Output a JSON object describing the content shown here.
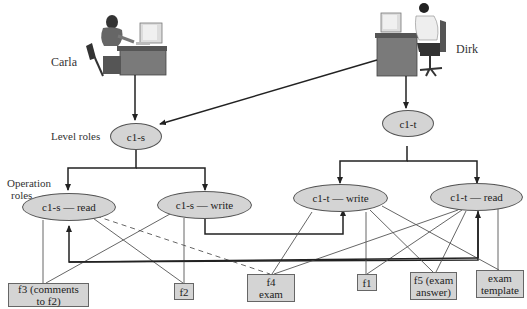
{
  "people": {
    "carla": {
      "name": "Carla"
    },
    "dirk": {
      "name": "Dirk"
    }
  },
  "labels": {
    "level_roles": "Level roles",
    "operation_roles_line1": "Operation",
    "operation_roles_line2": "roles"
  },
  "level_roles": [
    {
      "id": "c1s",
      "label": "c1-s"
    },
    {
      "id": "c1t",
      "label": "c1-t"
    }
  ],
  "operation_roles": [
    {
      "id": "c1s_read",
      "label": "c1-s — read"
    },
    {
      "id": "c1s_write",
      "label": "c1-s — write"
    },
    {
      "id": "c1t_write",
      "label": "c1-t — write"
    },
    {
      "id": "c1t_read",
      "label": "c1-t — read"
    }
  ],
  "files": [
    {
      "id": "f3",
      "line1": "f3 (comments",
      "line2": "to f2)"
    },
    {
      "id": "f2",
      "line1": "f2",
      "line2": ""
    },
    {
      "id": "f4",
      "line1": "f4",
      "line2": "exam"
    },
    {
      "id": "f1",
      "line1": "f1",
      "line2": ""
    },
    {
      "id": "f5",
      "line1": "f5 (exam",
      "line2": "answer)"
    },
    {
      "id": "template",
      "line1": "exam",
      "line2": "template"
    }
  ],
  "colors": {
    "node_fill": "#d4d4d4",
    "line": "#222222",
    "thin_line": "#555555"
  }
}
